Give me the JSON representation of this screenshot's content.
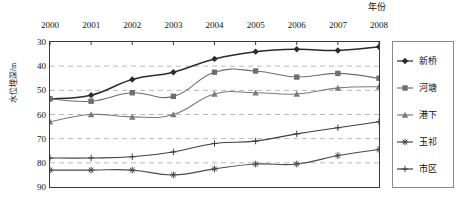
{
  "chart_data": {
    "type": "line",
    "title": "",
    "xlabel": "年份",
    "ylabel": "水位埋深/m",
    "categories": [
      "2000",
      "2001",
      "2002",
      "2003",
      "2004",
      "2005",
      "2006",
      "2007",
      "2008"
    ],
    "x_tick_labels": [
      "2000",
      "2001",
      "2002",
      "2003",
      "2004",
      "2005",
      "2006",
      "2007",
      "2008"
    ],
    "y_tick_labels": [
      "30",
      "40",
      "50",
      "60",
      "70",
      "80",
      "90"
    ],
    "y_ticks": [
      30,
      40,
      50,
      60,
      70,
      80,
      90
    ],
    "ylim": [
      90,
      30
    ],
    "y_inverted": true,
    "xlim": [
      2000,
      2008
    ],
    "grid": "horizontal-dashed",
    "legend_position": "right-outside",
    "series": [
      {
        "name": "新桥",
        "marker": "diamond",
        "color": "#2b2b2b",
        "values": [
          53.5,
          52.0,
          45.5,
          42.5,
          37.0,
          34.0,
          33.0,
          33.5,
          32.0
        ]
      },
      {
        "name": "河塘",
        "marker": "square",
        "color": "#6e6e6e",
        "values": [
          53.5,
          54.5,
          51.0,
          52.5,
          42.5,
          42.0,
          44.5,
          43.0,
          45.0
        ]
      },
      {
        "name": "港下",
        "marker": "triangle",
        "color": "#7a7a7a",
        "values": [
          63.0,
          60.0,
          61.0,
          60.0,
          51.5,
          51.0,
          51.5,
          49.0,
          48.5
        ]
      },
      {
        "name": "玉祁",
        "marker": "asterisk",
        "color": "#4a4a4a",
        "values": [
          83.0,
          83.0,
          83.0,
          85.0,
          82.5,
          80.5,
          80.5,
          77.0,
          74.5
        ]
      },
      {
        "name": "市区",
        "marker": "plus",
        "color": "#3f3f3f",
        "values": [
          78.0,
          78.0,
          77.5,
          75.5,
          72.0,
          71.0,
          68.0,
          65.5,
          63.0
        ]
      }
    ]
  },
  "legend": {
    "items": [
      {
        "label": "新桥"
      },
      {
        "label": "河塘"
      },
      {
        "label": "港下"
      },
      {
        "label": "玉祁"
      },
      {
        "label": "市区"
      }
    ]
  },
  "colors": {
    "frame": "#3a3a3a",
    "grid": "#b9b9b9",
    "legend_border": "#8a8a8a",
    "background": "#ffffff"
  }
}
